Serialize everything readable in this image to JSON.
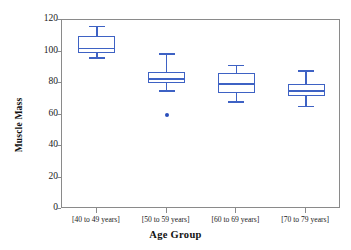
{
  "chart_data": {
    "type": "box",
    "title": "",
    "xlabel": "Age Group",
    "ylabel": "Muscle Mass",
    "categories": [
      "[40 to 49 years]",
      "[50 to 59 years]",
      "[60 to 69 years]",
      "[70 to 79 years]"
    ],
    "ylim": [
      0,
      120
    ],
    "yticks": [
      0,
      20,
      40,
      60,
      80,
      100,
      120
    ],
    "ytick_labels": [
      "0",
      "20",
      "40",
      "60",
      "80",
      "100",
      "120"
    ],
    "grid": false,
    "legend": "none",
    "series_color": "#3e62c4",
    "boxes": [
      {
        "category": "[40 to 49 years]",
        "whisker_low": 96.0,
        "q1": 99.0,
        "median": 102.0,
        "q3": 110.0,
        "whisker_high": 116.0,
        "outliers": []
      },
      {
        "category": "[50 to 59 years]",
        "whisker_low": 75.0,
        "q1": 80.0,
        "median": 82.5,
        "q3": 87.0,
        "whisker_high": 98.5,
        "outliers": [
          59.5
        ]
      },
      {
        "category": "[60 to 69 years]",
        "whisker_low": 68.0,
        "q1": 73.5,
        "median": 79.5,
        "q3": 86.5,
        "whisker_high": 91.0,
        "outliers": []
      },
      {
        "category": "[70 to 79 years]",
        "whisker_low": 65.0,
        "q1": 71.5,
        "median": 75.0,
        "q3": 79.5,
        "whisker_high": 87.5,
        "outliers": []
      }
    ]
  },
  "axes": {
    "y_title": "Muscle Mass",
    "x_title": "Age Group"
  }
}
